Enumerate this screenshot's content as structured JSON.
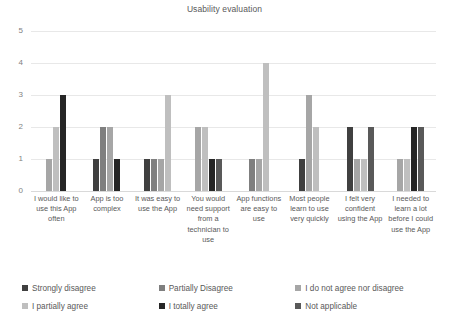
{
  "chart_data": {
    "type": "bar",
    "title": "Usability evaluation",
    "xlabel": "",
    "ylabel": "",
    "ylim": [
      0,
      5
    ],
    "yticks": [
      "0",
      "1",
      "2",
      "3",
      "4",
      "5"
    ],
    "grid": true,
    "legend_position": "bottom",
    "categories": [
      "I would like to use this App often",
      "App is too complex",
      "It was easy to use the App",
      "You would need support from a technician to use",
      "App functions are easy to use",
      "Most people learn to use very quickly",
      "I felt very confident using the App",
      "I needed to learn a lot before I could use the App"
    ],
    "series": [
      {
        "name": "Strongly disagree",
        "color": "#404040",
        "values": [
          0,
          1,
          1,
          0,
          0,
          1,
          2,
          0
        ]
      },
      {
        "name": "Partially Disagree",
        "color": "#7f7f7f",
        "values": [
          0,
          2,
          1,
          0,
          1,
          0,
          0,
          0
        ]
      },
      {
        "name": "I do not agree nor disagree",
        "color": "#a6a6a6",
        "values": [
          1,
          2,
          1,
          2,
          1,
          3,
          1,
          1
        ]
      },
      {
        "name": "I partially agree",
        "color": "#bfbfbf",
        "values": [
          2,
          0,
          3,
          2,
          4,
          2,
          1,
          1
        ]
      },
      {
        "name": "I totally agree",
        "color": "#262626",
        "values": [
          3,
          1,
          0,
          1,
          0,
          0,
          0,
          2
        ]
      },
      {
        "name": "Not applicable",
        "color": "#595959",
        "values": [
          0,
          0,
          0,
          1,
          0,
          0,
          2,
          2
        ]
      }
    ]
  },
  "legend": {
    "items": [
      {
        "label": "Strongly disagree",
        "color": "#404040"
      },
      {
        "label": "Partially Disagree",
        "color": "#7f7f7f"
      },
      {
        "label": "I do not agree nor disagree",
        "color": "#a6a6a6"
      },
      {
        "label": "I partially agree",
        "color": "#bfbfbf"
      },
      {
        "label": "I totally agree",
        "color": "#262626"
      },
      {
        "label": "Not applicable",
        "color": "#595959"
      }
    ]
  }
}
